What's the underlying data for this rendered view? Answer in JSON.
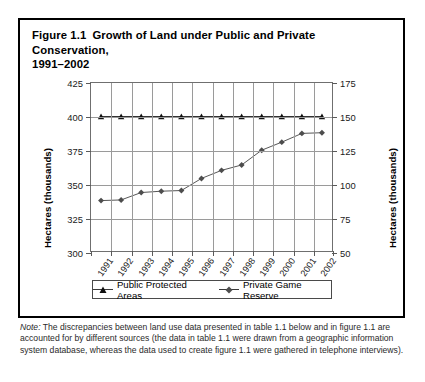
{
  "figure": {
    "title_line1": "Figure 1.1",
    "title_line2": "Growth of Land under Public and Private Conservation,",
    "title_line3": "1991–2002",
    "note_prefix": "Note:",
    "note_text": " The discrepancies between land use data presented in table 1.1 below and in figure 1.1 are accounted for by different sources (the data in table 1.1 were drawn from a geographic information system database, whereas the data used to create figure 1.1 were gathered in telephone interviews)."
  },
  "chart_data": {
    "type": "line",
    "xlabel": "",
    "ylabel": "Hectares (thousands)",
    "ylabel_right": "Hectares (thousands)",
    "categories": [
      "1991",
      "1992",
      "1993",
      "1994",
      "1995",
      "1996",
      "1997",
      "1998",
      "1999",
      "2000",
      "2001",
      "2002"
    ],
    "ylim": [
      300,
      425
    ],
    "yticks": [
      300,
      325,
      350,
      375,
      400,
      425
    ],
    "ylim_right": [
      50,
      175
    ],
    "yticks_right": [
      50,
      75,
      100,
      125,
      150,
      175
    ],
    "grid": true,
    "legend_position": "bottom",
    "series": [
      {
        "name": "Public Protected Areas",
        "axis": "left",
        "marker": "triangle",
        "color": "#1a1a1a",
        "values": [
          400,
          400,
          400,
          400,
          400,
          400,
          400,
          400,
          400,
          400,
          400,
          400
        ]
      },
      {
        "name": "Private Game Reserve",
        "axis": "left",
        "marker": "diamond",
        "color": "#555555",
        "values": [
          337.5,
          338,
          343.5,
          344.5,
          345,
          354,
          360,
          364,
          375,
          381,
          387.5,
          388
        ]
      }
    ]
  },
  "axes": {
    "left_ticks": [
      "425",
      "400",
      "375",
      "350",
      "325",
      "300"
    ],
    "right_ticks": [
      "175",
      "150",
      "125",
      "100",
      "75",
      "50"
    ],
    "left_title": "Hectares (thousands)",
    "right_title": "Hectares (thousands)"
  },
  "legend": {
    "items": [
      {
        "label": "Public Protected Areas",
        "marker": "triangle-marker"
      },
      {
        "label": "Private Game Reserve",
        "marker": "diamond-marker"
      }
    ]
  }
}
